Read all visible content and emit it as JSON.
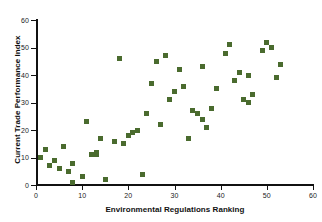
{
  "chart_data": {
    "type": "scatter",
    "title": "",
    "xlabel": "Environmental Regulations Ranking",
    "ylabel": "Current Trade Performance Index",
    "xlim": [
      0,
      60
    ],
    "ylim": [
      0,
      60
    ],
    "xticks": [
      0,
      10,
      20,
      30,
      40,
      50,
      60
    ],
    "yticks": [
      0,
      10,
      20,
      30,
      40,
      50,
      60
    ],
    "grid": false,
    "legend": "none",
    "marker": "square",
    "marker_color": "#4a6b2e",
    "axis_color": "#111111",
    "background_color": "#ffffff",
    "series": [
      {
        "name": "Countries",
        "points": [
          [
            1,
            10
          ],
          [
            2,
            13
          ],
          [
            3,
            7
          ],
          [
            4,
            9
          ],
          [
            5,
            6
          ],
          [
            6,
            14
          ],
          [
            7,
            5
          ],
          [
            8,
            1
          ],
          [
            8,
            8
          ],
          [
            10,
            3
          ],
          [
            11,
            23
          ],
          [
            12,
            11
          ],
          [
            13,
            12
          ],
          [
            13,
            11
          ],
          [
            14,
            17
          ],
          [
            15,
            2
          ],
          [
            17,
            16
          ],
          [
            18,
            46
          ],
          [
            19,
            15
          ],
          [
            20,
            18
          ],
          [
            21,
            19
          ],
          [
            22,
            20
          ],
          [
            22,
            20
          ],
          [
            23,
            4
          ],
          [
            24,
            26
          ],
          [
            25,
            37
          ],
          [
            26,
            45
          ],
          [
            27,
            22
          ],
          [
            28,
            47
          ],
          [
            29,
            31
          ],
          [
            30,
            34
          ],
          [
            31,
            42
          ],
          [
            32,
            36
          ],
          [
            33,
            17
          ],
          [
            34,
            27
          ],
          [
            35,
            26
          ],
          [
            36,
            24
          ],
          [
            36,
            43
          ],
          [
            37,
            21
          ],
          [
            38,
            28
          ],
          [
            39,
            35
          ],
          [
            41,
            48
          ],
          [
            42,
            51
          ],
          [
            43,
            38
          ],
          [
            44,
            41
          ],
          [
            45,
            31
          ],
          [
            46,
            30
          ],
          [
            46,
            40
          ],
          [
            47,
            33
          ],
          [
            49,
            49
          ],
          [
            50,
            52
          ],
          [
            51,
            50
          ],
          [
            52,
            39
          ],
          [
            53,
            44
          ]
        ]
      }
    ]
  },
  "axes": {
    "x_tick_labels": [
      "0",
      "10",
      "20",
      "30",
      "40",
      "50",
      "60"
    ],
    "y_tick_labels": [
      "0",
      "10",
      "20",
      "30",
      "40",
      "50",
      "60"
    ],
    "x_title": "Environmental Regulations Ranking",
    "y_title": "Current Trade Performance Index"
  }
}
